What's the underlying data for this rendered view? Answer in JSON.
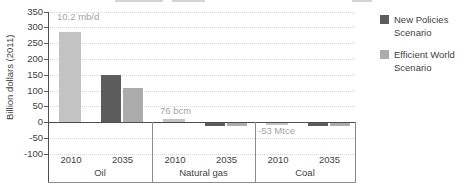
{
  "chart_data": {
    "type": "bar",
    "title": "",
    "ylabel": "Billion dollars (2011)",
    "ylim": [
      -100,
      350
    ],
    "ytick_step": 50,
    "yticks": [
      350,
      300,
      250,
      200,
      150,
      100,
      50,
      0,
      -50,
      -100
    ],
    "grid": true,
    "legend_position": "right",
    "series_colors": {
      "2010": "#c3c3c3",
      "New Policies Scenario": "#5c5c5c",
      "Efficient World Scenario": "#acacac"
    },
    "style": {
      "axis_color": "#4d4d4d",
      "grid_color": "#d9d9d9",
      "divider_color": "#8c8c8c",
      "label_color": "#3f3f3f",
      "annotation_color": "#a3a3a3"
    },
    "legend": [
      {
        "label": "New Policies Scenario",
        "color": "#5c5c5c"
      },
      {
        "label": "Efficient World Scenario",
        "color": "#acacac"
      }
    ],
    "groups": [
      {
        "label": "Oil",
        "annotation": "10.2 mb/d",
        "bars": [
          {
            "category": "2010",
            "series": "2010",
            "value": 285
          },
          {
            "category": "2035",
            "series": "New Policies Scenario",
            "value": 150
          },
          {
            "category": "2035",
            "series": "Efficient World Scenario",
            "value": 108
          }
        ]
      },
      {
        "label": "Natural gas",
        "annotation": "76 bcm",
        "bars": [
          {
            "category": "2010",
            "series": "2010",
            "value": 10
          },
          {
            "category": "2035",
            "series": "New Policies Scenario",
            "value": -8
          },
          {
            "category": "2035",
            "series": "Efficient World Scenario",
            "value": -9
          }
        ]
      },
      {
        "label": "Coal",
        "annotation": "-53 Mtce",
        "bars": [
          {
            "category": "2010",
            "series": "2010",
            "value": -6
          },
          {
            "category": "2035",
            "series": "New Policies Scenario",
            "value": -9
          },
          {
            "category": "2035",
            "series": "Efficient World Scenario",
            "value": -8
          }
        ]
      }
    ]
  }
}
